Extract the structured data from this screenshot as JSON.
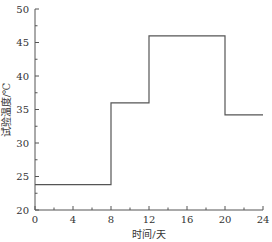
{
  "chart_data": {
    "type": "line",
    "subtype": "step",
    "title": "",
    "xlabel": "时间/天",
    "ylabel": "试验温度/℃",
    "xlim": [
      0,
      24
    ],
    "ylim": [
      20,
      50
    ],
    "x_ticks": [
      0,
      4,
      8,
      12,
      16,
      20,
      24
    ],
    "y_ticks": [
      20,
      25,
      30,
      35,
      40,
      45,
      50
    ],
    "grid": false,
    "legend": null,
    "series": [
      {
        "name": "试验温度",
        "color": "#555555",
        "steps": [
          {
            "x_start": 0,
            "x_end": 8,
            "y": 23.8
          },
          {
            "x_start": 8,
            "x_end": 12,
            "y": 36
          },
          {
            "x_start": 12,
            "x_end": 20,
            "y": 46
          },
          {
            "x_start": 20,
            "x_end": 24,
            "y": 34.2
          }
        ]
      }
    ]
  }
}
